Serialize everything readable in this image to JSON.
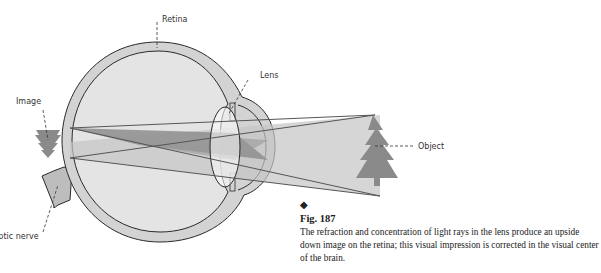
{
  "diagram": {
    "labels": {
      "retina": "Retina",
      "lens": "Lens",
      "image": "Image",
      "object": "Object",
      "optic_nerve": "Optic nerve"
    }
  },
  "caption": {
    "marker": "◆",
    "figure": "Fig. 187",
    "text": "The refraction and concentration of light rays in the lens produce an upside down image on the retina; this visual impression is corrected in the visual center of the brain."
  },
  "colors": {
    "eye_wall": "#d3d3d3",
    "eye_interior": "#e4e4e4",
    "ray_dark": "#8e8e8e",
    "ray_light": "#c4c4c4",
    "tree": "#8a8a8a",
    "outline": "#2a2a2a"
  }
}
